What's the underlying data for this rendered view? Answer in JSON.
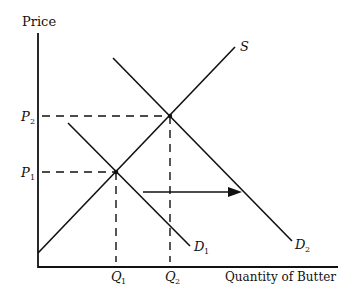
{
  "diagram": {
    "y_axis_label": "Price",
    "x_axis_label": "Quantity of Butter",
    "supply_label": "S",
    "demand_initial_label": "D",
    "demand_initial_sub": "1",
    "demand_new_label": "D",
    "demand_new_sub": "2",
    "price_1_label": "P",
    "price_1_sub": "1",
    "price_2_label": "P",
    "price_2_sub": "2",
    "quantity_1_label": "Q",
    "quantity_1_sub": "1",
    "quantity_2_label": "Q",
    "quantity_2_sub": "2",
    "shift_arrow": "rightward demand shift",
    "line_color": "#111111"
  }
}
